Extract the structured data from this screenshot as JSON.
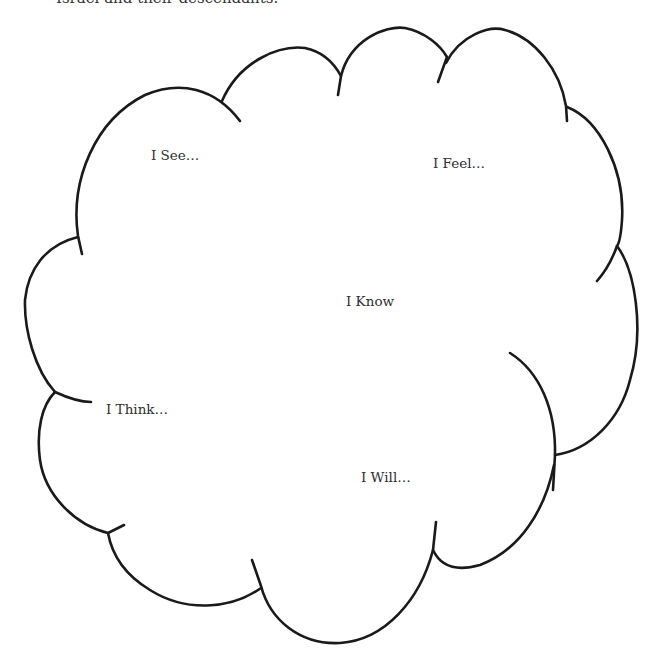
{
  "document": {
    "header_fragment": "Israel and their descendants."
  },
  "cloud": {
    "name": "thinking-cloud",
    "labels": {
      "see": "I See…",
      "feel": "I Feel…",
      "know": "I Know",
      "think": "I Think…",
      "will": "I Will…"
    }
  }
}
